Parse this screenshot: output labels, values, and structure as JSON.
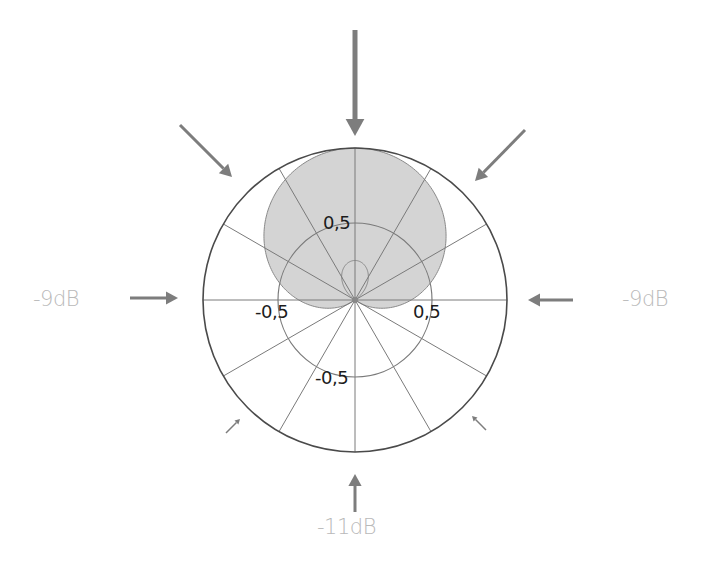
{
  "diagram": {
    "type": "polar-pickup-pattern",
    "pattern_name": "supercardioid",
    "center": [
      355,
      300
    ],
    "outer_radius": 152,
    "inner_radius": 77,
    "spoke_count": 12,
    "spoke_step_deg": 30,
    "pattern_formula": {
      "a": 0.37,
      "b": 0.63
    },
    "colors": {
      "background": "#ffffff",
      "grid_line": "#7a7a7a",
      "outer_circle": "#4a4a4a",
      "pattern_fill": "#d4d4d4",
      "pattern_stroke": "#8a8a8a",
      "arrow": "#7d7d7d",
      "db_label": "#b9b9b9",
      "axis_label": "#1c1c1c"
    },
    "axis_labels": [
      {
        "id": "top",
        "text": "0,5",
        "x": 323,
        "y": 212
      },
      {
        "id": "left",
        "text": "-0,5",
        "x": 255,
        "y": 301
      },
      {
        "id": "right",
        "text": "0,5",
        "x": 413,
        "y": 301
      },
      {
        "id": "bottom",
        "text": "-0,5",
        "x": 315,
        "y": 367
      }
    ],
    "db_labels": [
      {
        "id": "left",
        "text": "-9dB",
        "x": 33,
        "y": 287
      },
      {
        "id": "right",
        "text": "-9dB",
        "x": 622,
        "y": 287
      },
      {
        "id": "rear",
        "text": "-11dB",
        "x": 317,
        "y": 515
      }
    ],
    "arrows": [
      {
        "id": "front-0deg",
        "x1": 355,
        "y1": 30,
        "x2": 355,
        "y2": 136,
        "width": 5,
        "head": 17
      },
      {
        "id": "front-left-45deg",
        "x1": 180,
        "y1": 125,
        "x2": 232,
        "y2": 177,
        "width": 3,
        "head": 12
      },
      {
        "id": "front-right-45deg",
        "x1": 525,
        "y1": 130,
        "x2": 475,
        "y2": 181,
        "width": 3,
        "head": 12
      },
      {
        "id": "left-90deg",
        "x1": 130,
        "y1": 298,
        "x2": 178,
        "y2": 298,
        "width": 3,
        "head": 12
      },
      {
        "id": "right-90deg",
        "x1": 573,
        "y1": 300,
        "x2": 528,
        "y2": 300,
        "width": 3,
        "head": 12
      },
      {
        "id": "rear-left-135deg",
        "x1": 226,
        "y1": 433,
        "x2": 240,
        "y2": 419,
        "width": 1.5,
        "head": 5
      },
      {
        "id": "rear-right-135deg",
        "x1": 486,
        "y1": 430,
        "x2": 472,
        "y2": 416,
        "width": 1.5,
        "head": 5
      },
      {
        "id": "rear-180deg",
        "x1": 355,
        "y1": 512,
        "x2": 355,
        "y2": 474,
        "width": 3,
        "head": 12
      }
    ]
  },
  "chart_data": {
    "type": "polar",
    "title": "",
    "pattern": "supercardioid",
    "radial_ticks": [
      0.5,
      1.0
    ],
    "radial_tick_labels": [
      "0,5",
      "-0,5",
      "0,5",
      "-0,5"
    ],
    "angles_deg": [
      0,
      30,
      60,
      90,
      120,
      150,
      180,
      210,
      240,
      270,
      300,
      330
    ],
    "values": [
      1.0,
      0.92,
      0.69,
      0.37,
      0.06,
      -0.18,
      -0.26,
      -0.18,
      0.06,
      0.37,
      0.69,
      0.92
    ],
    "annotations": [
      {
        "direction_deg": 90,
        "text": "-9dB"
      },
      {
        "direction_deg": 270,
        "text": "-9dB"
      },
      {
        "direction_deg": 180,
        "text": "-11dB"
      }
    ],
    "grid": true
  }
}
